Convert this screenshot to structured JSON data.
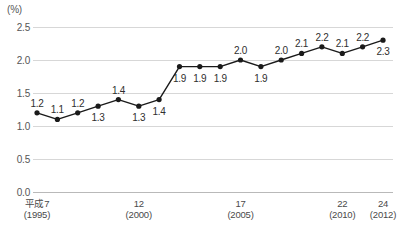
{
  "chart_data": {
    "type": "line",
    "title": "",
    "subtitle": "",
    "unit_label": "(%)",
    "xlabel": "",
    "ylabel": "",
    "ylim": [
      0.0,
      2.5
    ],
    "ytick_values": [
      2.5,
      2.0,
      1.5,
      1.0,
      0.5,
      0.0
    ],
    "ytick_labels": [
      "2.5",
      "2.0",
      "1.5",
      "1.0",
      "0.5",
      "0.0"
    ],
    "grid": true,
    "grid_axis": "y",
    "legend": null,
    "x": [
      1995,
      1996,
      1997,
      1998,
      1999,
      2000,
      2001,
      2002,
      2003,
      2004,
      2005,
      2006,
      2007,
      2008,
      2009,
      2010,
      2011,
      2012
    ],
    "values": [
      1.2,
      1.1,
      1.2,
      1.3,
      1.4,
      1.3,
      1.4,
      1.9,
      1.9,
      1.9,
      2.0,
      1.9,
      2.0,
      2.1,
      2.2,
      2.1,
      2.2,
      2.3
    ],
    "point_labels": [
      "1.2",
      "1.1",
      "1.2",
      "1.3",
      "1.4",
      "1.3",
      "1.4",
      "1.9",
      "1.9",
      "1.9",
      "2.0",
      "1.9",
      "2.0",
      "2.1",
      "2.2",
      "2.1",
      "2.2",
      "2.3"
    ],
    "label_positions": [
      "above",
      "above",
      "above",
      "below",
      "above",
      "below",
      "below",
      "below",
      "below",
      "below",
      "above",
      "below",
      "above",
      "above",
      "above",
      "above",
      "above",
      "below"
    ],
    "xticks": [
      {
        "era": "平成7",
        "year": "(1995)",
        "x": 1995
      },
      {
        "era": "12",
        "year": "(2000)",
        "x": 2000
      },
      {
        "era": "17",
        "year": "(2005)",
        "x": 2005
      },
      {
        "era": "22",
        "year": "(2010)",
        "x": 2010
      },
      {
        "era": "24",
        "year": "(2012)",
        "x": 2012
      }
    ],
    "colors": {
      "line": "#1a1a1a",
      "marker": "#1a1a1a",
      "grid": "#d7d7d7",
      "baseline": "#b9b9b9",
      "text": "#3a3a3a",
      "background": "#ffffff"
    }
  }
}
